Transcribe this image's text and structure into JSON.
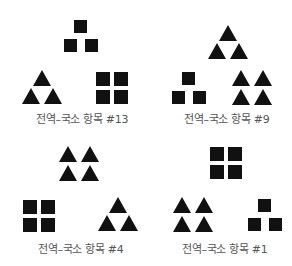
{
  "figure": {
    "panels": [
      {
        "id": "p13",
        "label": "전역–국소 항목 #13",
        "global_shape": "triangle-arrangement",
        "clusters": [
          "square-triangle",
          "triangle-triangle",
          "square-2x2"
        ]
      },
      {
        "id": "p9",
        "label": "전역–국소 항목 #9",
        "global_shape": "triangle-arrangement",
        "clusters": [
          "triangle-triangle",
          "square-triangle",
          "triangle-2x2"
        ]
      },
      {
        "id": "p4",
        "label": "전역–국소 항목 #4",
        "global_shape": "triangle-arrangement",
        "clusters": [
          "triangle-2x2",
          "square-2x2",
          "triangle-triangle"
        ]
      },
      {
        "id": "p1",
        "label": "전역–국소 항목 #1",
        "global_shape": "triangle-arrangement",
        "clusters": [
          "square-2x2",
          "triangle-2x2",
          "square-triangle"
        ]
      }
    ],
    "colors": {
      "shape": "#111111",
      "label": "#555555",
      "background": "#ffffff"
    }
  }
}
